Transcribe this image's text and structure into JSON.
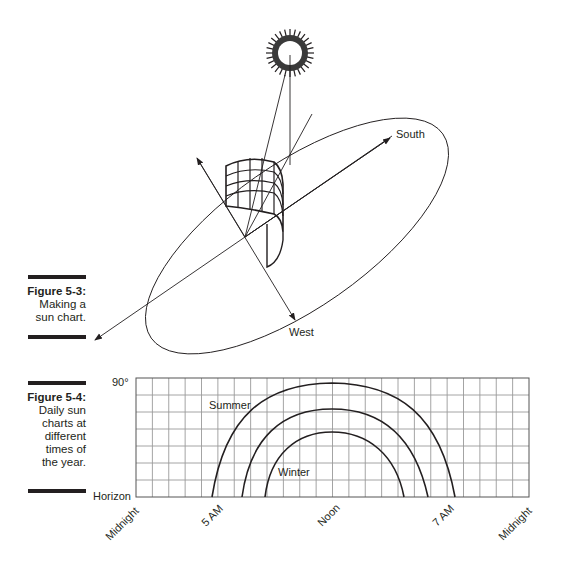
{
  "figure_5_3": {
    "number": "Figure 5-3:",
    "caption_lines": [
      "Making a",
      "sun chart."
    ],
    "labels": {
      "south": "South",
      "west": "West"
    },
    "icons": [
      "sun-icon",
      "solar-panel-icon",
      "compass-ellipse"
    ]
  },
  "figure_5_4": {
    "number": "Figure 5-4:",
    "caption_lines": [
      "Daily sun",
      "charts at",
      "different",
      "times of",
      "the year."
    ],
    "y_labels": {
      "top": "90°",
      "bottom": "Horizon"
    },
    "curve_labels": {
      "summer": "Summer",
      "winter": "Winter"
    },
    "x_labels": [
      "Midnight",
      "5 AM",
      "Noon",
      "7 AM",
      "Midnight"
    ]
  },
  "chart_data": {
    "type": "line",
    "title": "Daily sun charts at different times of the year",
    "xlabel": "Time of day",
    "ylabel": "Sun altitude",
    "x_tick_labels": [
      "Midnight",
      "5 AM",
      "Noon",
      "7 AM",
      "Midnight"
    ],
    "y_tick_labels": [
      "Horizon",
      "90°"
    ],
    "grid": true,
    "grid_columns": 24,
    "grid_rows": 7,
    "series": [
      {
        "name": "Summer",
        "rise_hour": 4.6,
        "set_hour": 19.4,
        "peak_fraction_of_90deg": 0.93
      },
      {
        "name": "Equinox (unlabeled)",
        "rise_hour": 6.5,
        "set_hour": 17.5,
        "peak_fraction_of_90deg": 0.72
      },
      {
        "name": "Winter",
        "rise_hour": 7.9,
        "set_hour": 16.1,
        "peak_fraction_of_90deg": 0.54
      }
    ]
  }
}
